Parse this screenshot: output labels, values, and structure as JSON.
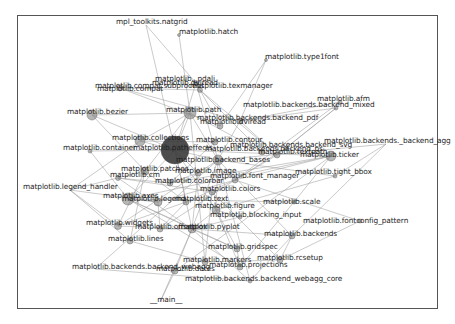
{
  "graph": {
    "title": "",
    "type": "network",
    "frame": {
      "left": 17,
      "top": 15,
      "right": 438,
      "bottom": 309
    },
    "edge_color": "#9a9a9a",
    "node_color": "#7a7a7a",
    "hub_color": "#3a3a3a",
    "nodes": [
      {
        "id": "mpl_toolkits.natgrid",
        "x": 146,
        "y": 25,
        "r": 0
      },
      {
        "id": "matplotlib.hatch",
        "x": 179,
        "y": 35,
        "r": 1.5
      },
      {
        "id": "matplotlib.type1font",
        "x": 266,
        "y": 60,
        "r": 1.5
      },
      {
        "id": "matplotlib._pdali",
        "x": 196,
        "y": 83,
        "r": 2.5
      },
      {
        "id": "matplotlib.compat.subprocess",
        "x": 120,
        "y": 88,
        "r": 3
      },
      {
        "id": "matplotlib.texmanager",
        "x": 200,
        "y": 90,
        "r": 2.5
      },
      {
        "id": "matplotlib.afm",
        "x": 340,
        "y": 102,
        "r": 2
      },
      {
        "id": "matplotlib.backends.backend_mixed",
        "x": 336,
        "y": 108,
        "r": 2
      },
      {
        "id": "matplotlib.bezier",
        "x": 92,
        "y": 115,
        "r": 5
      },
      {
        "id": "matplotlib.path",
        "x": 190,
        "y": 113,
        "r": 6
      },
      {
        "id": "matplotlib.backends.backend_pdf",
        "x": 240,
        "y": 121,
        "r": 3
      },
      {
        "id": "matplotlib.dviread",
        "x": 220,
        "y": 126,
        "r": 3
      },
      {
        "id": "matplotlib.collections",
        "x": 140,
        "y": 141,
        "r": 5
      },
      {
        "id": "matplotlib.container",
        "x": 90,
        "y": 151,
        "r": 2
      },
      {
        "id": "matplotlib.contour",
        "x": 215,
        "y": 142,
        "r": 3
      },
      {
        "id": "matplotlib.patheffects",
        "x": 175,
        "y": 150,
        "r": 14
      },
      {
        "id": "matplotlib.backends.backend_svg",
        "x": 286,
        "y": 148,
        "r": 2
      },
      {
        "id": "matplotlib.backends.backend_ps",
        "x": 277,
        "y": 155,
        "r": 3
      },
      {
        "id": "matplotlib.textpath",
        "x": 262,
        "y": 152,
        "r": 3
      },
      {
        "id": "matplotlib.ticker",
        "x": 331,
        "y": 156,
        "r": 5
      },
      {
        "id": "matplotlib.backends._backend_agg",
        "x": 386,
        "y": 144,
        "r": 0
      },
      {
        "id": "matplotlib.backend_bases",
        "x": 218,
        "y": 160,
        "r": 5
      },
      {
        "id": "matplotlib.tight_bbox",
        "x": 335,
        "y": 176,
        "r": 2
      },
      {
        "id": "matplotlib.patches",
        "x": 145,
        "y": 171,
        "r": 4
      },
      {
        "id": "matplotlib.image",
        "x": 198,
        "y": 173,
        "r": 3
      },
      {
        "id": "matplotlib.font_manager",
        "x": 235,
        "y": 180,
        "r": 3
      },
      {
        "id": "matplotlib.cm",
        "x": 118,
        "y": 178,
        "r": 2.5
      },
      {
        "id": "matplotlib.colorbar",
        "x": 170,
        "y": 183,
        "r": 3
      },
      {
        "id": "matplotlib.colors",
        "x": 212,
        "y": 192,
        "r": 3
      },
      {
        "id": "matplotlib.legend_handler",
        "x": 70,
        "y": 190,
        "r": 0
      },
      {
        "id": "matplotlib.axes",
        "x": 128,
        "y": 199,
        "r": 6
      },
      {
        "id": "matplotlib.legend",
        "x": 158,
        "y": 202,
        "r": 4
      },
      {
        "id": "matplotlib.text",
        "x": 186,
        "y": 202,
        "r": 3
      },
      {
        "id": "matplotlib.scale",
        "x": 294,
        "y": 202,
        "r": 2
      },
      {
        "id": "matplotlib.figure",
        "x": 216,
        "y": 210,
        "r": 4
      },
      {
        "id": "matplotlib.blocking_input",
        "x": 240,
        "y": 217,
        "r": 2
      },
      {
        "id": "matplotlib.fontconfig_pattern",
        "x": 360,
        "y": 221,
        "r": 2
      },
      {
        "id": "matplotlib.widgets",
        "x": 118,
        "y": 226,
        "r": 3.5
      },
      {
        "id": "matplotlib.offsetbox",
        "x": 160,
        "y": 229,
        "r": 3
      },
      {
        "id": "matplotlib.pyplot",
        "x": 192,
        "y": 229,
        "r": 4
      },
      {
        "id": "matplotlib.backends",
        "x": 292,
        "y": 236,
        "r": 3
      },
      {
        "id": "matplotlib.lines",
        "x": 130,
        "y": 241,
        "r": 3
      },
      {
        "id": "matplotlib.gridspec",
        "x": 237,
        "y": 249,
        "r": 3
      },
      {
        "id": "matplotlib.rcsetup",
        "x": 280,
        "y": 260,
        "r": 3
      },
      {
        "id": "matplotlib.markers",
        "x": 205,
        "y": 262,
        "r": 3
      },
      {
        "id": "matplotlib.projections",
        "x": 240,
        "y": 267,
        "r": 3
      },
      {
        "id": "matplotlib.backends.backend_webagg",
        "x": 95,
        "y": 269,
        "r": 0
      },
      {
        "id": "matplotlib.dates",
        "x": 175,
        "y": 271,
        "r": 3
      },
      {
        "id": "matplotlib.backends.backend_webagg_core",
        "x": 250,
        "y": 281,
        "r": 2
      },
      {
        "id": "__main__",
        "x": 160,
        "y": 302,
        "r": 0
      }
    ],
    "labels": [
      {
        "text": "mpl_toolkits.natgrid",
        "x": 116,
        "y": 22
      },
      {
        "text": "matplotlib.hatch",
        "x": 179,
        "y": 32
      },
      {
        "text": "matplotlib.type1font",
        "x": 265,
        "y": 57
      },
      {
        "text": "matplotlib._pdali",
        "x": 155,
        "y": 79
      },
      {
        "text": "matplotlib.dviread",
        "x": 152,
        "y": 83
      },
      {
        "text": "matplotlib.compat.subprocess",
        "x": 95,
        "y": 86
      },
      {
        "text": "matplotlib.compat",
        "x": 97,
        "y": 89
      },
      {
        "text": "matplotlib.texmanager",
        "x": 190,
        "y": 86
      },
      {
        "text": "matplotlib.afm",
        "x": 317,
        "y": 99
      },
      {
        "text": "matplotlib.backends.backend_mixed",
        "x": 243,
        "y": 105
      },
      {
        "text": "matplotlib.bezier",
        "x": 67,
        "y": 112
      },
      {
        "text": "matplotlib.path",
        "x": 166,
        "y": 110
      },
      {
        "text": "matplotlib.backends.backend_pdf",
        "x": 197,
        "y": 118
      },
      {
        "text": "matplotlib.dviread",
        "x": 200,
        "y": 122
      },
      {
        "text": "matplotlib.collections",
        "x": 112,
        "y": 138
      },
      {
        "text": "matplotlib.container",
        "x": 63,
        "y": 148
      },
      {
        "text": "matplotlib.contour",
        "x": 196,
        "y": 140
      },
      {
        "text": "matplotlib.patheffects",
        "x": 133,
        "y": 148
      },
      {
        "text": "matplotlib.backends.backend_svg",
        "x": 230,
        "y": 145
      },
      {
        "text": "matplotlib.backends.backend_ps",
        "x": 205,
        "y": 149
      },
      {
        "text": "matplotlib.textpath",
        "x": 258,
        "y": 152
      },
      {
        "text": "matplotlib.ticker",
        "x": 300,
        "y": 155
      },
      {
        "text": "matplotlib.backends._backend_agg",
        "x": 324,
        "y": 141
      },
      {
        "text": "matplotlib.backend_bases",
        "x": 176,
        "y": 160
      },
      {
        "text": "matplotlib.tight_bbox",
        "x": 295,
        "y": 172
      },
      {
        "text": "matplotlib.patches",
        "x": 121,
        "y": 169
      },
      {
        "text": "matplotlib.image",
        "x": 175,
        "y": 171
      },
      {
        "text": "matplotlib.font_manager",
        "x": 210,
        "y": 176
      },
      {
        "text": "matplotlib.cm",
        "x": 110,
        "y": 175
      },
      {
        "text": "matplotlib.colorbar",
        "x": 155,
        "y": 181
      },
      {
        "text": "matplotlib.colors",
        "x": 200,
        "y": 189
      },
      {
        "text": "matplotlib.legend_handler",
        "x": 23,
        "y": 187
      },
      {
        "text": "matplotlib.axes",
        "x": 103,
        "y": 196
      },
      {
        "text": "matplotlib.legend",
        "x": 122,
        "y": 199
      },
      {
        "text": "matplotlib.text",
        "x": 175,
        "y": 199
      },
      {
        "text": "matplotlib.scale",
        "x": 263,
        "y": 202
      },
      {
        "text": "matplotlib.figure",
        "x": 195,
        "y": 206
      },
      {
        "text": "matplotlib.blocking_input",
        "x": 210,
        "y": 215
      },
      {
        "text": "matplotlib.fontconfig_pattern",
        "x": 303,
        "y": 221
      },
      {
        "text": "matplotlib.widgets",
        "x": 86,
        "y": 223
      },
      {
        "text": "matplotlib.offsetbox",
        "x": 135,
        "y": 227
      },
      {
        "text": "matplotlib.pyplot",
        "x": 178,
        "y": 227
      },
      {
        "text": "matplotlib.backends",
        "x": 264,
        "y": 234
      },
      {
        "text": "matplotlib.lines",
        "x": 108,
        "y": 239
      },
      {
        "text": "matplotlib.gridspec",
        "x": 208,
        "y": 247
      },
      {
        "text": "matplotlib.rcsetup",
        "x": 257,
        "y": 258
      },
      {
        "text": "matplotlib.markers",
        "x": 183,
        "y": 260
      },
      {
        "text": "matplotlib.projections",
        "x": 209,
        "y": 265
      },
      {
        "text": "matplotlib.backends.backend_webagg",
        "x": 72,
        "y": 267
      },
      {
        "text": "matplotlib.dates",
        "x": 156,
        "y": 269
      },
      {
        "text": "matplotlib.backends.backend_webagg_core",
        "x": 185,
        "y": 279
      },
      {
        "text": "__main__",
        "x": 150,
        "y": 300
      }
    ],
    "edges": [
      [
        "mpl_toolkits.natgrid",
        "matplotlib.patheffects"
      ],
      [
        "mpl_toolkits.natgrid",
        "matplotlib._pdali"
      ],
      [
        "matplotlib.hatch",
        "matplotlib.path"
      ],
      [
        "matplotlib.type1font",
        "matplotlib.backends.backend_pdf"
      ],
      [
        "matplotlib.type1font",
        "matplotlib.dviread"
      ],
      [
        "matplotlib._pdali",
        "matplotlib.patheffects"
      ],
      [
        "matplotlib._pdali",
        "matplotlib.backend_bases"
      ],
      [
        "matplotlib.texmanager",
        "matplotlib.textpath"
      ],
      [
        "matplotlib.texmanager",
        "matplotlib.dviread"
      ],
      [
        "matplotlib.texmanager",
        "matplotlib.backends.backend_ps"
      ],
      [
        "matplotlib.compat.subprocess",
        "matplotlib.texmanager"
      ],
      [
        "matplotlib.compat.subprocess",
        "matplotlib.backends.backend_pdf"
      ],
      [
        "matplotlib.compat.subprocess",
        "matplotlib.dviread"
      ],
      [
        "matplotlib.afm",
        "matplotlib.backends.backend_pdf"
      ],
      [
        "matplotlib.afm",
        "matplotlib.font_manager"
      ],
      [
        "matplotlib.backends.backend_mixed",
        "matplotlib.backends.backend_pdf"
      ],
      [
        "matplotlib.backends.backend_mixed",
        "matplotlib.backends.backend_ps"
      ],
      [
        "matplotlib.backends.backend_mixed",
        "matplotlib.backends.backend_svg"
      ],
      [
        "matplotlib.bezier",
        "matplotlib.path"
      ],
      [
        "matplotlib.bezier",
        "matplotlib.patches"
      ],
      [
        "matplotlib.bezier",
        "matplotlib.patheffects"
      ],
      [
        "matplotlib.path",
        "matplotlib.patheffects"
      ],
      [
        "matplotlib.path",
        "matplotlib.collections"
      ],
      [
        "matplotlib.path",
        "matplotlib.textpath"
      ],
      [
        "matplotlib.path",
        "matplotlib.backend_bases"
      ],
      [
        "matplotlib.path",
        "matplotlib.patches"
      ],
      [
        "matplotlib.path",
        "matplotlib.markers"
      ],
      [
        "matplotlib.backends.backend_pdf",
        "matplotlib.backend_bases"
      ],
      [
        "matplotlib.backends.backend_pdf",
        "matplotlib.backends.backend_ps"
      ],
      [
        "matplotlib.collections",
        "matplotlib.patheffects"
      ],
      [
        "matplotlib.collections",
        "matplotlib.legend_handler"
      ],
      [
        "matplotlib.collections",
        "matplotlib.contour"
      ],
      [
        "matplotlib.container",
        "matplotlib.patheffects"
      ],
      [
        "matplotlib.container",
        "matplotlib.axes"
      ],
      [
        "matplotlib.contour",
        "matplotlib.colorbar"
      ],
      [
        "matplotlib.patheffects",
        "matplotlib.backend_bases"
      ],
      [
        "matplotlib.patheffects",
        "matplotlib.text"
      ],
      [
        "matplotlib.patheffects",
        "matplotlib.ticker"
      ],
      [
        "matplotlib.patheffects",
        "matplotlib.image"
      ],
      [
        "matplotlib.patheffects",
        "matplotlib.axes"
      ],
      [
        "matplotlib.patheffects",
        "matplotlib.pyplot"
      ],
      [
        "matplotlib.patheffects",
        "matplotlib.figure"
      ],
      [
        "matplotlib.backends.backend_svg",
        "matplotlib.font_manager"
      ],
      [
        "matplotlib.backends.backend_ps",
        "matplotlib.font_manager"
      ],
      [
        "matplotlib.backends._backend_agg",
        "matplotlib.backend_bases"
      ],
      [
        "matplotlib.backends._backend_agg",
        "matplotlib.backends"
      ],
      [
        "matplotlib.backends._backend_agg",
        "matplotlib.tight_bbox"
      ],
      [
        "matplotlib.ticker",
        "matplotlib.axes"
      ],
      [
        "matplotlib.ticker",
        "matplotlib.scale"
      ],
      [
        "matplotlib.ticker",
        "matplotlib.colorbar"
      ],
      [
        "matplotlib.ticker",
        "matplotlib.dates"
      ],
      [
        "matplotlib.ticker",
        "matplotlib.font_manager"
      ],
      [
        "matplotlib.backend_bases",
        "matplotlib.figure"
      ],
      [
        "matplotlib.backend_bases",
        "matplotlib.pyplot"
      ],
      [
        "matplotlib.backend_bases",
        "matplotlib.backends"
      ],
      [
        "matplotlib.backend_bases",
        "matplotlib.widgets"
      ],
      [
        "matplotlib.tight_bbox",
        "matplotlib.backend_bases"
      ],
      [
        "matplotlib.tight_bbox",
        "matplotlib.figure"
      ],
      [
        "matplotlib.patches",
        "matplotlib.legend_handler"
      ],
      [
        "matplotlib.patches",
        "matplotlib.text"
      ],
      [
        "matplotlib.patches",
        "matplotlib.lines"
      ],
      [
        "matplotlib.patches",
        "matplotlib.widgets"
      ],
      [
        "matplotlib.image",
        "matplotlib.colorbar"
      ],
      [
        "matplotlib.image",
        "matplotlib.pyplot"
      ],
      [
        "matplotlib.font_manager",
        "matplotlib.text"
      ],
      [
        "matplotlib.font_manager",
        "matplotlib.fontconfig_pattern"
      ],
      [
        "matplotlib.font_manager",
        "matplotlib.legend"
      ],
      [
        "matplotlib.font_manager",
        "matplotlib.offsetbox"
      ],
      [
        "matplotlib.cm",
        "matplotlib.colorbar"
      ],
      [
        "matplotlib.cm",
        "matplotlib.pyplot"
      ],
      [
        "matplotlib.colors",
        "matplotlib.cm"
      ],
      [
        "matplotlib.colors",
        "matplotlib.rcsetup"
      ],
      [
        "matplotlib.colors",
        "matplotlib.markers"
      ],
      [
        "matplotlib.legend_handler",
        "matplotlib.legend"
      ],
      [
        "matplotlib.legend_handler",
        "matplotlib.widgets"
      ],
      [
        "matplotlib.axes",
        "matplotlib.legend"
      ],
      [
        "matplotlib.axes",
        "matplotlib.pyplot"
      ],
      [
        "matplotlib.axes",
        "matplotlib.gridspec"
      ],
      [
        "matplotlib.axes",
        "matplotlib.projections"
      ],
      [
        "matplotlib.legend",
        "matplotlib.offsetbox"
      ],
      [
        "matplotlib.text",
        "matplotlib.offsetbox"
      ],
      [
        "matplotlib.text",
        "matplotlib.widgets"
      ],
      [
        "matplotlib.scale",
        "matplotlib.axes"
      ],
      [
        "matplotlib.scale",
        "matplotlib.projections"
      ],
      [
        "matplotlib.figure",
        "matplotlib.blocking_input"
      ],
      [
        "matplotlib.figure",
        "matplotlib.pyplot"
      ],
      [
        "matplotlib.figure",
        "matplotlib.gridspec"
      ],
      [
        "matplotlib.figure",
        "matplotlib.projections"
      ],
      [
        "matplotlib.blocking_input",
        "matplotlib.pyplot"
      ],
      [
        "matplotlib.fontconfig_pattern",
        "matplotlib.rcsetup"
      ],
      [
        "matplotlib.pyplot",
        "matplotlib.backends"
      ],
      [
        "matplotlib.pyplot",
        "matplotlib.gridspec"
      ],
      [
        "matplotlib.pyplot",
        "matplotlib.dates"
      ],
      [
        "matplotlib.pyplot",
        "matplotlib.__main__"
      ],
      [
        "matplotlib.offsetbox",
        "matplotlib.pyplot"
      ],
      [
        "matplotlib.widgets",
        "matplotlib.pyplot"
      ],
      [
        "matplotlib.lines",
        "matplotlib.markers"
      ],
      [
        "matplotlib.lines",
        "matplotlib.legend_handler"
      ],
      [
        "matplotlib.backends",
        "matplotlib.rcsetup"
      ],
      [
        "matplotlib.gridspec",
        "matplotlib.projections"
      ],
      [
        "matplotlib.markers",
        "matplotlib.rcsetup"
      ],
      [
        "matplotlib.backends.backend_webagg",
        "matplotlib.backends.backend_webagg_core"
      ],
      [
        "matplotlib.backends.backend_webagg",
        "matplotlib.backend_bases"
      ],
      [
        "matplotlib.dates",
        "__main__"
      ],
      [
        "matplotlib.backends.backend_webagg_core",
        "matplotlib.backend_bases"
      ],
      [
        "matplotlib.backends.backend_webagg_core",
        "matplotlib.backends"
      ],
      [
        "matplotlib.backends.backend_webagg_core",
        "matplotlib.pyplot"
      ]
    ]
  }
}
